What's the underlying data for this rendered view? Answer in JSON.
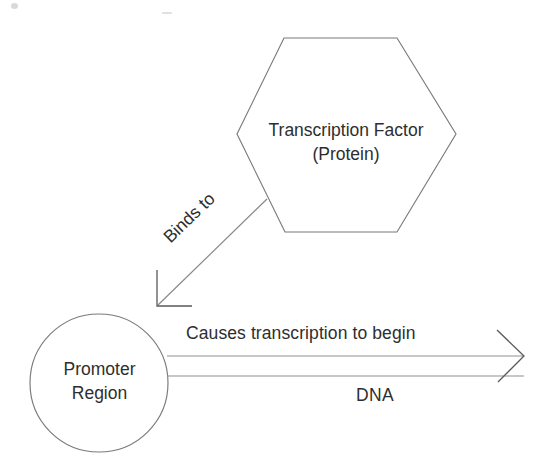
{
  "diagram": {
    "background_color": "#ffffff",
    "stroke_color": "#7a7a7a",
    "text_color": "#2e2e2e",
    "nodes": {
      "hexagon": {
        "shape": "hexagon",
        "label_line_1": "Transcription Factor",
        "label_line_2": "(Protein)"
      },
      "circle": {
        "shape": "circle",
        "label_line_1": "Promoter",
        "label_line_2": "Region"
      }
    },
    "edges": {
      "binds_to": {
        "label": "Binds to",
        "from": "hexagon",
        "to": "circle",
        "style": "diagonal-arrow"
      },
      "transcription": {
        "label": "Causes transcription to begin",
        "from": "circle",
        "to": "dna-end",
        "style": "double-line-arrow"
      }
    },
    "strand_label": "DNA"
  }
}
